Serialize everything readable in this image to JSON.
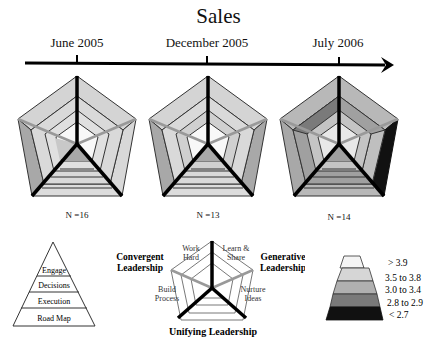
{
  "title": "Sales",
  "timeline": {
    "dates": [
      {
        "label": "June 2005",
        "x": 77
      },
      {
        "label": "December 2005",
        "x": 207
      },
      {
        "label": "July 2006",
        "x": 338
      }
    ]
  },
  "radars": [
    {
      "date": "June 2005",
      "n_label": "N =16",
      "cx": 77
    },
    {
      "date": "December 2005",
      "n_label": "N =13",
      "cx": 208
    },
    {
      "date": "July 2006",
      "n_label": "N =14",
      "cx": 339
    }
  ],
  "pyramid": {
    "levels": [
      "Engage",
      "Decisions",
      "Execution",
      "Road Map"
    ]
  },
  "key_diagram": {
    "axes": {
      "top_left": "Work Hard",
      "top_right": "Learn & Share",
      "left": "Build Process",
      "right": "Nurture Ideas"
    },
    "groups": {
      "convergent": "Convergent Leadership",
      "generative": "Generative Leadership",
      "unifying": "Unifying Leadership"
    }
  },
  "legend": {
    "items": [
      {
        "label": "> 3.9",
        "color": "#f4f4f4"
      },
      {
        "label": "3.5 to 3.8",
        "color": "#d6d6d6"
      },
      {
        "label": "3.0 to 3.4",
        "color": "#b0b0b0"
      },
      {
        "label": "2.8 to 2.9",
        "color": "#7a7a7a"
      },
      {
        "label": "< 2.7",
        "color": "#111111"
      }
    ]
  },
  "colors": {
    "light": "#d9d9d9",
    "mid": "#b8b8b8",
    "dark": "#8c8c8c",
    "black": "#111111"
  }
}
